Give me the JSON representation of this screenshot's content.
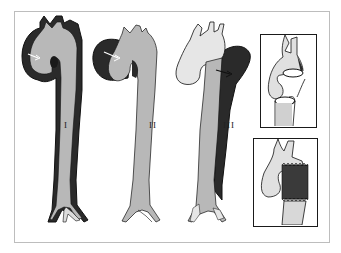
{
  "figure": {
    "panels": [
      {
        "id": "I",
        "label": "I",
        "description": "Aortic dissection type I: false lumen extends from ascending aorta through arch down to iliac bifurcation"
      },
      {
        "id": "II",
        "label": "II",
        "description": "Aortic dissection type II: false lumen confined to ascending aorta"
      },
      {
        "id": "III",
        "label": "III",
        "description": "Aortic dissection type III: false lumen begins distal to left subclavian artery, extending down descending aorta"
      }
    ],
    "insets": [
      {
        "id": "inset-top",
        "description": "Transected aorta with separated ends showing dissected wall layers"
      },
      {
        "id": "inset-bottom",
        "description": "Repaired aorta with interposition graft (dark textured sleeve)"
      }
    ]
  },
  "colors": {
    "true_lumen": "#b8b8b8",
    "false_lumen": "#2a2a2a",
    "unaffected_vessel": "#e6e6e6",
    "outline": "#111111",
    "graft": "#3a3a3a",
    "frame": "#bdbdbd"
  }
}
